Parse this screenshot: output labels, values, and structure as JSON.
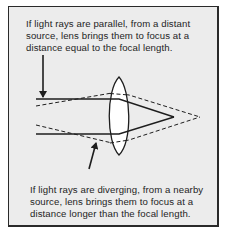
{
  "figure": {
    "caption_top": {
      "lines": [
        "If light rays are parallel, from a distant",
        "source, lens brings them to focus at a",
        "distance equal to the focal length."
      ]
    },
    "caption_bottom": {
      "lines": [
        "If light rays are diverging, from a nearby",
        "source, lens brings them to focus at a",
        "distance longer than the focal length."
      ]
    },
    "colors": {
      "background": "#ececec",
      "line": "#1e1e1e",
      "lens_fill": "#ffffff"
    },
    "elements": [
      "convex-lens",
      "parallel-rays (solid)",
      "diverging-rays (dashed)",
      "arrow-to-parallel-rays",
      "arrow-to-diverging-rays"
    ]
  }
}
